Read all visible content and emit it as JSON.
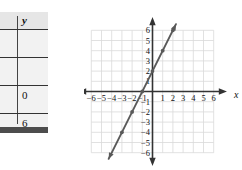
{
  "table": {
    "header_y": "y",
    "rows": [
      {
        "y": ""
      },
      {
        "y": ""
      },
      {
        "y": "0"
      },
      {
        "y": "6"
      }
    ]
  },
  "graph": {
    "x_axis_label": "x",
    "y_axis_label": "y",
    "x_ticks": [
      "-6",
      "-5",
      "-4",
      "-3",
      "-2",
      "-1",
      "1",
      "2",
      "3",
      "4",
      "5",
      "6"
    ],
    "y_ticks": [
      "6",
      "5",
      "4",
      "3",
      "2",
      "1",
      "-1",
      "-2",
      "-3",
      "-4",
      "-5",
      "-6"
    ],
    "line_color": "#595959",
    "grid_color": "#d9d9d9",
    "axis_color": "#333333"
  },
  "chart_data": {
    "type": "line",
    "title": "",
    "xlabel": "x",
    "ylabel": "y",
    "xlim": [
      -6,
      6
    ],
    "ylim": [
      -6,
      6
    ],
    "grid": true,
    "legend": "none",
    "equation": "y = 2x + 2",
    "slope": 2,
    "intercept": 2,
    "x": [
      -3,
      -2,
      -1,
      0,
      1,
      2
    ],
    "y": [
      -4,
      -2,
      0,
      2,
      4,
      6
    ],
    "points": [
      {
        "x": -3,
        "y": -4
      },
      {
        "x": -2,
        "y": -2
      },
      {
        "x": -1,
        "y": 0
      },
      {
        "x": 0,
        "y": 2
      },
      {
        "x": 1,
        "y": 4
      },
      {
        "x": 2,
        "y": 6
      }
    ],
    "xticks": [
      -6,
      -5,
      -4,
      -3,
      -2,
      -1,
      1,
      2,
      3,
      4,
      5,
      6
    ],
    "yticks": [
      -6,
      -5,
      -4,
      -3,
      -2,
      -1,
      1,
      2,
      3,
      4,
      5,
      6
    ],
    "series": [
      {
        "name": "y = 2x + 2",
        "values": [
          -4,
          -2,
          0,
          2,
          4,
          6
        ]
      }
    ]
  }
}
